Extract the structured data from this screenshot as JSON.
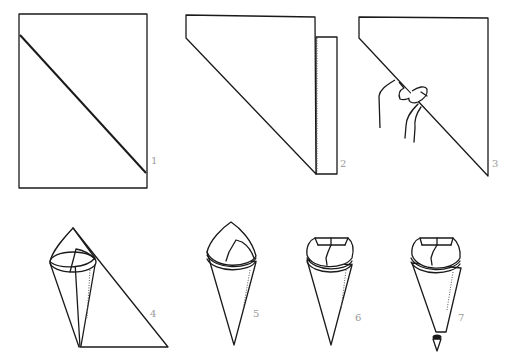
{
  "figure": {
    "steps": [
      {
        "number": "1",
        "description": "Rectangle of paper with diagonal fold line"
      },
      {
        "number": "2",
        "description": "Paper folded along diagonal"
      },
      {
        "number": "3",
        "description": "Holding folded triangle at midpoint of long edge"
      },
      {
        "number": "4",
        "description": "Rolling paper into a cone"
      },
      {
        "number": "5",
        "description": "Completed cone with point at top"
      },
      {
        "number": "6",
        "description": "Top points folded inward"
      },
      {
        "number": "7",
        "description": "Tip snipped off cone"
      }
    ]
  },
  "colors": {
    "line": "#1a1a1a",
    "label": "#9a9a9a",
    "background": "#ffffff"
  }
}
